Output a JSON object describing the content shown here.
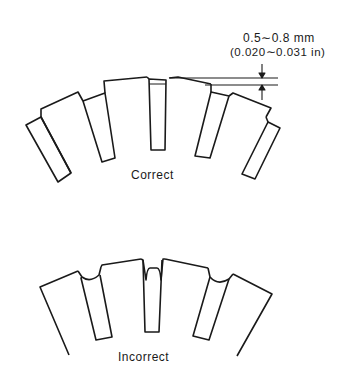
{
  "diagram": {
    "dimension": {
      "metric": "0.5∼0.8 mm",
      "imperial": "(0.020∼0.031 in)"
    },
    "examples": [
      {
        "label": "Correct",
        "description": "Mica undercut squarely to depth between segments"
      },
      {
        "label": "Incorrect",
        "description": "Mica left with rounded/V undercut edges"
      }
    ],
    "colors": {
      "line": "#1a1a1a",
      "background": "#ffffff"
    }
  }
}
